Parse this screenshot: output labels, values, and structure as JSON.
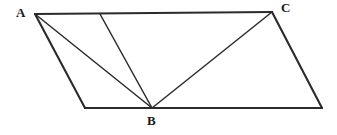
{
  "figure": {
    "background_color": "#ffffff",
    "line_color": "#2b2b2b",
    "label_color": "#1a1a1a",
    "width": 337,
    "height": 135,
    "labels": [
      {
        "id": "A",
        "text": "A",
        "x": 16,
        "y": 6
      },
      {
        "id": "B",
        "text": "B",
        "x": 147,
        "y": 114
      },
      {
        "id": "C",
        "text": "C",
        "x": 281,
        "y": 1
      }
    ],
    "points": {
      "A": {
        "x": 35,
        "y": 14
      },
      "C": {
        "x": 272,
        "y": 12
      },
      "B": {
        "x": 152,
        "y": 108
      },
      "D": {
        "x": 85,
        "y": 108
      },
      "E": {
        "x": 322,
        "y": 108
      },
      "T": {
        "x": 100,
        "y": 14
      }
    },
    "segments": [
      {
        "name": "top-edge-A-to-C",
        "from": "A",
        "to": "C",
        "kind": "outline"
      },
      {
        "name": "right-edge-C-to-E",
        "from": "C",
        "to": "E",
        "kind": "outline"
      },
      {
        "name": "bottom-edge-E-to-B",
        "from": "E",
        "to": "B",
        "kind": "outline"
      },
      {
        "name": "bottom-edge-B-to-D",
        "from": "B",
        "to": "D",
        "kind": "outline"
      },
      {
        "name": "left-edge-D-to-A",
        "from": "D",
        "to": "A",
        "kind": "outline"
      },
      {
        "name": "cevian-A-to-B",
        "from": "A",
        "to": "B",
        "kind": "inner"
      },
      {
        "name": "cevian-T-to-B",
        "from": "T",
        "to": "B",
        "kind": "inner"
      },
      {
        "name": "cevian-B-to-C",
        "from": "B",
        "to": "C",
        "kind": "inner"
      }
    ]
  }
}
